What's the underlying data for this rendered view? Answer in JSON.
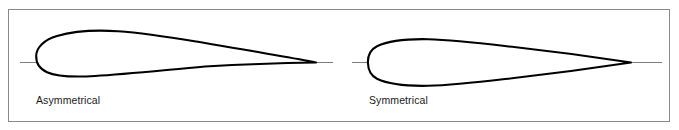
{
  "figure": {
    "background_color": "#ffffff",
    "frame": {
      "border_color": "#8a8a8a",
      "name": "figure-border"
    },
    "stroke_color": "#000000",
    "chord_line_color": "#6e6e6e"
  },
  "airfoils": [
    {
      "id": "asymmetrical",
      "label": "Asymmetrical",
      "icon": "airfoil-cambered-icon",
      "chord_line": {
        "x1": 20,
        "x2": 333,
        "y": 62
      },
      "leading_edge": {
        "x": 36,
        "y": 62
      },
      "trailing_edge": {
        "x": 316,
        "y": 62
      },
      "max_upper": {
        "x": 118,
        "y": 31
      },
      "max_lower": {
        "x": 112,
        "y": 74
      }
    },
    {
      "id": "symmetrical",
      "label": "Symmetrical",
      "icon": "airfoil-symmetric-icon",
      "chord_line": {
        "x1": 352,
        "x2": 662,
        "y": 62
      },
      "leading_edge": {
        "x": 368,
        "y": 62
      },
      "trailing_edge": {
        "x": 631,
        "y": 62
      },
      "max_upper": {
        "x": 448,
        "y": 39
      },
      "max_lower": {
        "x": 448,
        "y": 85
      }
    }
  ]
}
